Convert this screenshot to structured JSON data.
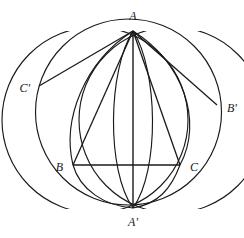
{
  "figure": {
    "kind": "geometry-diagram",
    "canvas": {
      "width": 244,
      "height": 238,
      "background": "#ffffff"
    },
    "stroke": {
      "color": "#1a1a1a",
      "width": 1.15
    },
    "points": [
      {
        "name": "A",
        "label": "A",
        "x": 133,
        "y": 31,
        "label_x": 133,
        "label_y": 16,
        "anchor": "center"
      },
      {
        "name": "B",
        "label": "B",
        "x": 73,
        "y": 165,
        "label_x": 63,
        "label_y": 167,
        "anchor": "right"
      },
      {
        "name": "C",
        "label": "C",
        "x": 180,
        "y": 165,
        "label_x": 190,
        "label_y": 167,
        "anchor": "left"
      },
      {
        "name": "A'",
        "label": "A'",
        "x": 133,
        "y": 208,
        "label_x": 133,
        "label_y": 222,
        "anchor": "center"
      },
      {
        "name": "B'",
        "label": "B'",
        "x": 217,
        "y": 105,
        "label_x": 227,
        "label_y": 108,
        "anchor": "left"
      },
      {
        "name": "C'",
        "label": "C'",
        "x": 39,
        "y": 86,
        "label_x": 30,
        "label_y": 88,
        "anchor": "right"
      }
    ],
    "circumcircle": {
      "name": "circumcircle",
      "cx": 128.5,
      "cy": 112,
      "r": 93
    },
    "arcs": [
      {
        "name": "arc-B-center",
        "cx": 73,
        "cy": 165,
        "r": 68,
        "from_deg": -118,
        "to_deg": 50
      },
      {
        "name": "arc-C-center",
        "cx": 180,
        "cy": 165,
        "r": 68,
        "from_deg": 130,
        "to_deg": 298
      },
      {
        "name": "arc-left-bulge",
        "cx": 133,
        "cy": 119,
        "r": 89,
        "from_deg": 0,
        "to_deg": 0
      }
    ],
    "segments": [
      {
        "name": "segment-A-Aprime",
        "from": "A",
        "to": "A'"
      },
      {
        "name": "segment-B-C",
        "from": "B",
        "to": "C"
      },
      {
        "name": "segment-A-B",
        "from": "A",
        "to": "B"
      },
      {
        "name": "segment-A-C",
        "from": "A",
        "to": "C"
      },
      {
        "name": "segment-A-Bprime",
        "from": "A",
        "to": "B'"
      },
      {
        "name": "segment-A-Cprime",
        "from": "A",
        "to": "C'"
      }
    ]
  }
}
